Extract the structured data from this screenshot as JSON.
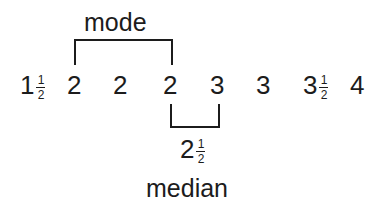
{
  "diagram": {
    "mode_label": "mode",
    "median_label": "median",
    "median_value": {
      "whole": "2",
      "num": "1",
      "den": "2"
    },
    "values": [
      {
        "whole": "1",
        "num": "1",
        "den": "2"
      },
      {
        "whole": "2"
      },
      {
        "whole": "2"
      },
      {
        "whole": "2"
      },
      {
        "whole": "3"
      },
      {
        "whole": "3"
      },
      {
        "whole": "3",
        "num": "1",
        "den": "2"
      },
      {
        "whole": "4"
      }
    ],
    "mode_bracket_spans": [
      1,
      3
    ],
    "median_bracket_spans": [
      3,
      4
    ]
  }
}
